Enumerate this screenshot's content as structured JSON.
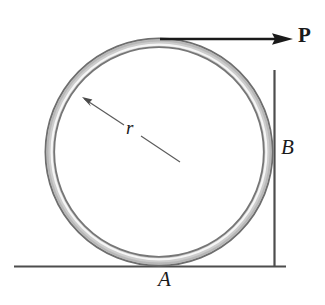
{
  "figure": {
    "kind": "statics-free-body-diagram",
    "background_color": "#ffffff",
    "canvas": {
      "width": 325,
      "height": 305
    }
  },
  "labels": {
    "radius": "r",
    "ground_contact": "A",
    "wall_contact": "B",
    "force": "P"
  },
  "geometry": {
    "ring": {
      "center_x": 159,
      "center_y": 152,
      "radius": 113,
      "tube_thickness": 9,
      "outline_color": "#6b6b6b",
      "body_color": "#d9d9d9",
      "highlight_color": "#f2f2f2"
    },
    "ground": {
      "y": 266,
      "x_start": 14,
      "x_end": 286,
      "line_color": "#4d4d4d",
      "shadow_color": "#c9c9c9"
    },
    "wall": {
      "x": 274,
      "y_start": 70,
      "y_end": 266,
      "line_color": "#4d4d4d",
      "shadow_color": "#c9c9c9"
    },
    "force_arrow": {
      "x_start": 160,
      "x_end": 293,
      "y": 39,
      "color": "#1a1a1a",
      "line_width": 2.6,
      "head_length": 17,
      "head_width": 12
    },
    "radius_arrow": {
      "x_tail": 179,
      "y_tail": 161,
      "x_tip": 83,
      "y_tip": 98,
      "color": "#555555",
      "line_width": 1.2,
      "head_length": 9,
      "head_width": 6
    }
  },
  "colors": {
    "ink": "#1a1a1a",
    "surface_line": "#4d4d4d",
    "hatch_shadow": "#c9c9c9",
    "metal_light": "#f2f2f2",
    "metal_mid": "#d0d0d0",
    "metal_dark": "#7a7a7a"
  }
}
